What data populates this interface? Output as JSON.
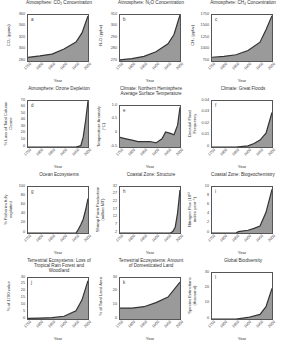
{
  "figure": {
    "x_label": "Year",
    "x_ticks": [
      "1750",
      "1800",
      "1850",
      "1900",
      "1950",
      "2000"
    ],
    "fill_color": "#9a9a9a",
    "line_color": "#333333"
  },
  "panels": [
    {
      "letter": "a",
      "title": "Atmosphere: CO₂ Concentration",
      "ylabel": "CO₂ (ppmv)",
      "yticks": [
        "360",
        "340",
        "320",
        "300",
        "280"
      ]
    },
    {
      "letter": "b",
      "title": "Atmosphere: N₂O Concentration",
      "ylabel": "N₂O (ppbv)",
      "yticks": [
        "310",
        "300",
        "290",
        "280",
        "270"
      ]
    },
    {
      "letter": "c",
      "title": "Atmosphere: CH₄ Concentration",
      "ylabel": "CH₄ (ppbv)",
      "yticks": [
        "1750",
        "1500",
        "1250",
        "1000",
        "750"
      ]
    },
    {
      "letter": "d",
      "title": "Atmosphere: Ozone Depletion",
      "ylabel": "% Loss of Total Column Ozone",
      "yticks": [
        "70",
        "60",
        "50",
        "40",
        "30",
        "20",
        "10",
        "0"
      ]
    },
    {
      "letter": "e",
      "title": "Climate: Northern Hemisphere Average Surface Temperature",
      "ylabel": "Temperature Anomaly (°C)",
      "yticks": [
        "1.0",
        "0.5",
        "0",
        "-0.5"
      ]
    },
    {
      "letter": "f",
      "title": "Climate: Great Floods",
      "ylabel": "Decadal Flood Frequency",
      "yticks": [
        "0.04",
        "0.03",
        "0.02",
        "0.01",
        "0"
      ]
    },
    {
      "letter": "g",
      "title": "Ocean Ecosystems",
      "ylabel": "% Fisheries fully exploited",
      "yticks": [
        "100",
        "80",
        "60",
        "40",
        "20",
        "0"
      ]
    },
    {
      "letter": "h",
      "title": "Coastal Zone: Structure",
      "ylabel": "Shrimp Farm Production (million MT)",
      "yticks": [
        "32",
        "27",
        "22",
        "17",
        "12",
        "7",
        "2"
      ]
    },
    {
      "letter": "i",
      "title": "Coastal Zone: Biogeochemistry",
      "ylabel": "Nitrogen Flux (10¹² moles year⁻¹)",
      "yticks": [
        "10",
        "8",
        "6",
        "4",
        "2",
        "0"
      ]
    },
    {
      "letter": "j",
      "title": "Terrestrial Ecosystems: Loss of Tropical Rain Forest and Woodland",
      "ylabel": "% of 1700 value",
      "yticks": [
        "30",
        "25",
        "20",
        "15",
        "10",
        "5",
        "0"
      ]
    },
    {
      "letter": "k",
      "title": "Terrestrial Ecosystems: Amount of Domesticated Land",
      "ylabel": "% of Total Land Area",
      "yticks": [
        "30",
        "20",
        "10",
        "0"
      ]
    },
    {
      "letter": "l",
      "title": "Global Biodiversity",
      "ylabel": "Species Extinctions (thousand)",
      "yticks": [
        "30",
        "20",
        "10",
        "0"
      ]
    }
  ],
  "chart_data": [
    {
      "type": "area",
      "panel": "a",
      "title": "Atmosphere: CO₂ Concentration",
      "xlabel": "Year",
      "ylabel": "CO₂ (ppmv)",
      "x": [
        1750,
        1800,
        1850,
        1900,
        1950,
        1975,
        2000
      ],
      "values": [
        278,
        281,
        285,
        296,
        311,
        331,
        368
      ],
      "ylim": [
        270,
        370
      ]
    },
    {
      "type": "area",
      "panel": "b",
      "title": "Atmosphere: N₂O Concentration",
      "xlabel": "Year",
      "ylabel": "N₂O (ppbv)",
      "x": [
        1750,
        1800,
        1850,
        1900,
        1950,
        1975,
        2000
      ],
      "values": [
        271,
        272,
        274,
        278,
        285,
        293,
        312
      ],
      "ylim": [
        270,
        310
      ]
    },
    {
      "type": "area",
      "panel": "c",
      "title": "Atmosphere: CH₄ Concentration",
      "xlabel": "Year",
      "ylabel": "CH₄ (ppbv)",
      "x": [
        1750,
        1800,
        1850,
        1900,
        1950,
        1975,
        2000
      ],
      "values": [
        790,
        810,
        850,
        950,
        1150,
        1450,
        1780
      ],
      "ylim": [
        700,
        1800
      ]
    },
    {
      "type": "area",
      "panel": "d",
      "title": "Atmosphere: Ozone Depletion",
      "xlabel": "Year",
      "ylabel": "% Loss of Total Column Ozone",
      "x": [
        1750,
        1950,
        1970,
        1980,
        1990,
        2000
      ],
      "values": [
        0,
        0,
        2,
        15,
        40,
        70
      ],
      "ylim": [
        0,
        70
      ]
    },
    {
      "type": "area",
      "panel": "e",
      "title": "Climate: Northern Hemisphere Average Surface Temperature",
      "xlabel": "Year",
      "ylabel": "Temperature Anomaly (°C)",
      "x": [
        1750,
        1775,
        1800,
        1825,
        1850,
        1875,
        1900,
        1925,
        1940,
        1960,
        1975,
        1990,
        2000
      ],
      "values": [
        -0.15,
        -0.2,
        -0.25,
        -0.3,
        -0.3,
        -0.3,
        -0.35,
        -0.2,
        0.05,
        0.0,
        -0.05,
        0.3,
        0.95
      ],
      "ylim": [
        -0.5,
        1.0
      ]
    },
    {
      "type": "area",
      "panel": "f",
      "title": "Climate: Great Floods",
      "xlabel": "Year",
      "ylabel": "Decadal Flood Frequency",
      "x": [
        1750,
        1850,
        1900,
        1925,
        1950,
        1975,
        2000
      ],
      "values": [
        0,
        0,
        0.001,
        0.003,
        0.006,
        0.012,
        0.03
      ],
      "ylim": [
        0,
        0.04
      ]
    },
    {
      "type": "area",
      "panel": "g",
      "title": "Ocean Ecosystems",
      "xlabel": "Year",
      "ylabel": "% Fisheries fully exploited",
      "x": [
        1750,
        1950,
        1960,
        1970,
        1980,
        1990,
        2000
      ],
      "values": [
        0,
        0,
        8,
        18,
        30,
        50,
        75
      ],
      "ylim": [
        0,
        100
      ]
    },
    {
      "type": "area",
      "panel": "h",
      "title": "Coastal Zone: Structure",
      "xlabel": "Year",
      "ylabel": "Shrimp Farm Production (million MT)",
      "x": [
        1750,
        1960,
        1970,
        1980,
        1990,
        2000
      ],
      "values": [
        0,
        0,
        1,
        4,
        14,
        30
      ],
      "ylim": [
        0,
        32
      ]
    },
    {
      "type": "area",
      "panel": "i",
      "title": "Coastal Zone: Biogeochemistry",
      "xlabel": "Year",
      "ylabel": "Nitrogen Flux (10¹² moles year⁻¹)",
      "x": [
        1750,
        1850,
        1860,
        1900,
        1925,
        1950,
        1975,
        2000
      ],
      "values": [
        0,
        0,
        0.3,
        0.6,
        1.0,
        1.5,
        4.5,
        9.5
      ],
      "ylim": [
        0,
        10
      ]
    },
    {
      "type": "area",
      "panel": "j",
      "title": "Terrestrial Ecosystems: Loss of Tropical Rain Forest and Woodland",
      "xlabel": "Year",
      "ylabel": "% of 1700 value",
      "x": [
        1750,
        1800,
        1850,
        1900,
        1950,
        1975,
        2000
      ],
      "values": [
        0.5,
        0.7,
        1,
        2,
        6,
        14,
        28
      ],
      "ylim": [
        0,
        30
      ]
    },
    {
      "type": "area",
      "panel": "k",
      "title": "Terrestrial Ecosystems: Amount of Domesticated Land",
      "xlabel": "Year",
      "ylabel": "% of Total Land Area",
      "x": [
        1750,
        1800,
        1850,
        1900,
        1950,
        2000
      ],
      "values": [
        8,
        8,
        9,
        12,
        16,
        27
      ],
      "ylim": [
        0,
        30
      ]
    },
    {
      "type": "area",
      "panel": "l",
      "title": "Global Biodiversity",
      "xlabel": "Year",
      "ylabel": "Species Extinctions (thousand)",
      "x": [
        1750,
        1850,
        1900,
        1950,
        1975,
        2000
      ],
      "values": [
        0,
        0,
        1,
        3,
        8,
        20
      ],
      "ylim": [
        0,
        30
      ]
    }
  ]
}
